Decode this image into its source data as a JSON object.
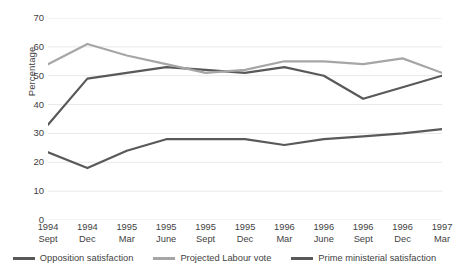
{
  "chart_data": {
    "type": "line",
    "title": "",
    "xlabel": "",
    "ylabel": "Percentage",
    "ylim": [
      0,
      70
    ],
    "ytick_step": 10,
    "yticks": [
      70,
      60,
      50,
      40,
      30,
      20,
      10,
      0
    ],
    "grid": true,
    "legend_position": "bottom",
    "categories": [
      {
        "year": "1994",
        "month": "Sept"
      },
      {
        "year": "1994",
        "month": "Dec"
      },
      {
        "year": "1995",
        "month": "Mar"
      },
      {
        "year": "1995",
        "month": "June"
      },
      {
        "year": "1995",
        "month": "Sept"
      },
      {
        "year": "1995",
        "month": "Dec"
      },
      {
        "year": "1996",
        "month": "Mar"
      },
      {
        "year": "1996",
        "month": "June"
      },
      {
        "year": "1996",
        "month": "Sept"
      },
      {
        "year": "1996",
        "month": "Dec"
      },
      {
        "year": "1997",
        "month": "Mar"
      }
    ],
    "series": [
      {
        "name": "Opposition satisfaction",
        "color": "#595959",
        "values": [
          33,
          49,
          51,
          53,
          52,
          51,
          53,
          50,
          42,
          46,
          50
        ]
      },
      {
        "name": "Projected Labour vote",
        "color": "#a6a6a6",
        "values": [
          54,
          61,
          57,
          54,
          51,
          52,
          55,
          55,
          54,
          56,
          51
        ]
      },
      {
        "name": "Prime ministerial satisfaction",
        "color": "#595959",
        "values": [
          23.5,
          18,
          24,
          28,
          28,
          28,
          26,
          28,
          29,
          30,
          31.5
        ]
      }
    ]
  },
  "axis": {
    "y_title": "Percentage"
  },
  "legend": {
    "items": [
      {
        "label": "Opposition satisfaction",
        "color": "#595959"
      },
      {
        "label": "Projected Labour vote",
        "color": "#a6a6a6"
      },
      {
        "label": "Prime ministerial satisfaction",
        "color": "#595959"
      }
    ]
  }
}
